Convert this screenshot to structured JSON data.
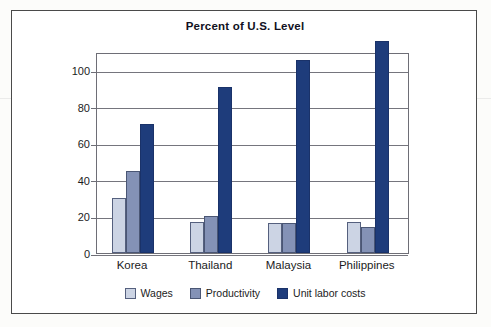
{
  "chart_data": {
    "type": "bar",
    "title": "Percent of U.S. Level",
    "xlabel": "",
    "ylabel": "",
    "ylim": [
      0,
      110
    ],
    "yticks": [
      0,
      20,
      40,
      60,
      80,
      100
    ],
    "ytick_labels": [
      "0",
      "20",
      "40",
      "60",
      "80",
      "100"
    ],
    "grid": true,
    "legend_position": "bottom",
    "categories": [
      "Korea",
      "Thailand",
      "Malaysia",
      "Philippines"
    ],
    "series": [
      {
        "name": "Wages",
        "color": "#ccd4e4",
        "values": [
          30,
          17,
          16.5,
          17
        ]
      },
      {
        "name": "Productivity",
        "color": "#8492b6",
        "values": [
          45,
          20.5,
          16.5,
          14
        ]
      },
      {
        "name": "Unit labor costs",
        "color": "#1e3c7b",
        "values": [
          70.5,
          91,
          105.5,
          116
        ]
      }
    ]
  },
  "legend": {
    "items": [
      {
        "label": "Wages",
        "swatch": "wages"
      },
      {
        "label": "Productivity",
        "swatch": "productivity"
      },
      {
        "label": "Unit labor costs",
        "swatch": "unit"
      }
    ]
  },
  "colors": {
    "wages": "#ccd4e4",
    "productivity": "#8492b6",
    "unit_labor_costs": "#1e3c7b",
    "axis": "#6e6e76",
    "frame": "#4a4a4a",
    "text": "#1b1b22",
    "background": "#ffffff"
  }
}
